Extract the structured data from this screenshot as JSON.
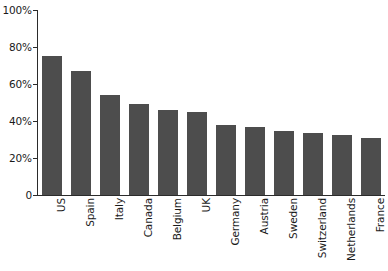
{
  "chart_data": {
    "type": "bar",
    "title": "",
    "subtitle": "",
    "xlabel": "",
    "ylabel": "",
    "categories": [
      "US",
      "Spain",
      "Italy",
      "Canada",
      "Belgium",
      "UK",
      "Germany",
      "Austria",
      "Sweden",
      "Switzerland",
      "Netherlands",
      "France"
    ],
    "values": [
      75,
      67,
      54,
      49,
      46,
      45,
      38,
      36.5,
      34.5,
      33.5,
      32.5,
      31
    ],
    "ylim": [
      0,
      100
    ],
    "y_ticks": [
      0,
      20,
      40,
      60,
      80,
      100
    ],
    "y_tick_labels": [
      "0",
      "20%",
      "40%",
      "60%",
      "80%",
      "100%"
    ],
    "grid": false,
    "legend": null,
    "series": [
      {
        "name": "",
        "values": [
          75,
          67,
          54,
          49,
          46,
          45,
          38,
          36.5,
          34.5,
          33.5,
          32.5,
          31
        ]
      }
    ],
    "colors": {
      "bar_fill": "#4d4d4d",
      "axis": "#2b2b2b",
      "text": "#1a1a1a",
      "background": "#ffffff"
    },
    "annotations": []
  }
}
